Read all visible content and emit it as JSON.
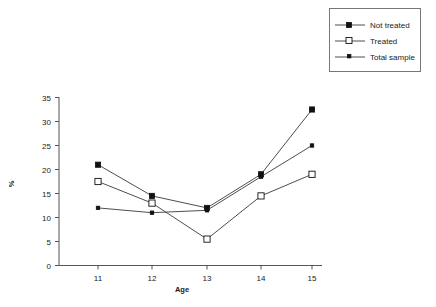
{
  "chart_data": {
    "type": "line",
    "title": "",
    "xlabel": "Age",
    "ylabel": "%",
    "categories": [
      "11",
      "12",
      "13",
      "14",
      "15"
    ],
    "x": [
      11,
      12,
      13,
      14,
      15
    ],
    "xlim": [
      10.5,
      15.6
    ],
    "ylim": [
      0,
      35
    ],
    "ytick_labels": [
      "0",
      "5",
      "10",
      "15",
      "20",
      "25",
      "30",
      "35"
    ],
    "yticks": [
      0,
      5,
      10,
      15,
      20,
      25,
      30,
      35
    ],
    "xtick_labels": [
      "11",
      "12",
      "13",
      "14",
      "15"
    ],
    "grid": false,
    "legend_position": "top-right",
    "series": [
      {
        "name": "Not treated",
        "marker": "filled-square",
        "values": [
          21.0,
          14.5,
          12.0,
          19.0,
          32.5
        ]
      },
      {
        "name": "Treated",
        "marker": "open-square",
        "values": [
          17.5,
          13.0,
          5.5,
          14.5,
          19.0
        ]
      },
      {
        "name": "Total sample",
        "marker": "small-filled-dot",
        "values": [
          12.0,
          11.0,
          11.5,
          18.5,
          25.0
        ]
      }
    ]
  },
  "axes": {
    "y_label": "%",
    "x_label": "Age",
    "y_tick_0": "0",
    "y_tick_1": "5",
    "y_tick_2": "10",
    "y_tick_3": "15",
    "y_tick_4": "20",
    "y_tick_5": "25",
    "y_tick_6": "30",
    "y_tick_7": "35",
    "x_tick_0": "11",
    "x_tick_1": "12",
    "x_tick_2": "13",
    "x_tick_3": "14",
    "x_tick_4": "15"
  },
  "legend": {
    "item_0": "Not treated",
    "item_1": "Treated",
    "item_2": "Total sample"
  },
  "colors": {
    "line": "#3a3a3a",
    "axis": "#555555",
    "marker": "#111111",
    "background": "#ffffff",
    "legend_border": "#777777"
  }
}
